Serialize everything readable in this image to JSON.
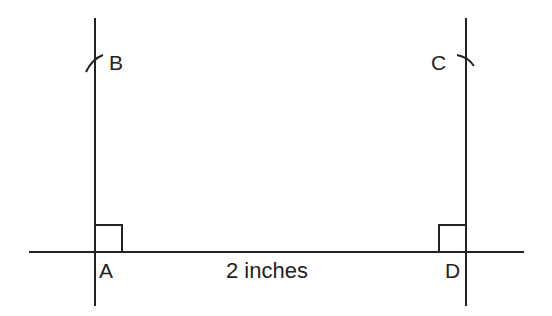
{
  "diagram": {
    "type": "geometric-construction",
    "stroke_color": "#222222",
    "background": "#ffffff",
    "points": {
      "A": {
        "label": "A",
        "x": 95,
        "y": 252
      },
      "B": {
        "label": "B",
        "x": 95,
        "y": 60
      },
      "C": {
        "label": "C",
        "x": 466,
        "y": 60
      },
      "D": {
        "label": "D",
        "x": 466,
        "y": 252
      }
    },
    "base_line": {
      "x1": 29,
      "y1": 252,
      "x2": 524,
      "y2": 252
    },
    "left_perpendicular": {
      "x1": 95,
      "y1": 18,
      "x2": 95,
      "y2": 306
    },
    "right_perpendicular": {
      "x1": 466,
      "y1": 18,
      "x2": 466,
      "y2": 306
    },
    "right_angle_marks": [
      "A",
      "D"
    ],
    "arcs": [
      "B",
      "C"
    ],
    "measurement": {
      "label": "2 inches",
      "segment": "AD"
    }
  }
}
